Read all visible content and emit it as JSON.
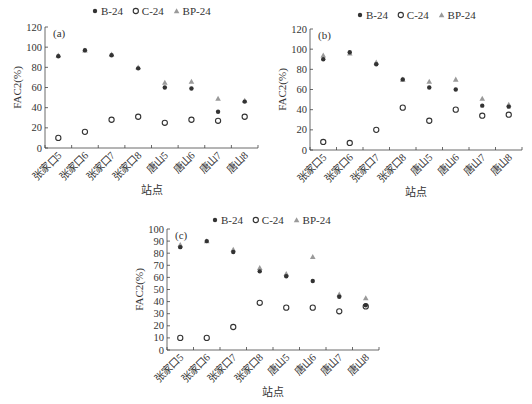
{
  "chart_data": [
    {
      "type": "scatter",
      "panel_label": "(a)",
      "title": "",
      "xlabel": "站点",
      "ylabel": "FAC2(%)",
      "ylim": [
        0,
        120
      ],
      "yticks": [
        0,
        20,
        40,
        60,
        80,
        100,
        120
      ],
      "grid": false,
      "legend_position": "top",
      "categories": [
        "张家口5",
        "张家口6",
        "张家口7",
        "张家口8",
        "唐山5",
        "唐山6",
        "唐山7",
        "唐山8"
      ],
      "series": [
        {
          "name": "B-24",
          "marker": "filled-circle",
          "color": "#333333",
          "values": [
            91,
            97,
            92,
            79,
            60,
            59,
            36,
            46
          ]
        },
        {
          "name": "C-24",
          "marker": "open-circle",
          "color": "#333333",
          "values": [
            10,
            16,
            28,
            31,
            25,
            28,
            27,
            31
          ]
        },
        {
          "name": "BP-24",
          "marker": "triangle",
          "color": "#9a9a9a",
          "values": [
            92,
            97,
            93,
            80,
            65,
            66,
            49,
            47
          ]
        }
      ]
    },
    {
      "type": "scatter",
      "panel_label": "(b)",
      "title": "",
      "xlabel": "站点",
      "ylabel": "FAC2(%)",
      "ylim": [
        0,
        120
      ],
      "yticks": [
        0,
        20,
        40,
        60,
        80,
        100,
        120
      ],
      "grid": false,
      "legend_position": "top",
      "categories": [
        "张家口5",
        "张家口6",
        "张家口7",
        "张家口8",
        "唐山5",
        "唐山6",
        "唐山7",
        "唐山8"
      ],
      "series": [
        {
          "name": "B-24",
          "marker": "filled-circle",
          "color": "#333333",
          "values": [
            90,
            97,
            85,
            70,
            62,
            60,
            44,
            43
          ]
        },
        {
          "name": "C-24",
          "marker": "open-circle",
          "color": "#333333",
          "values": [
            8,
            7,
            20,
            42,
            29,
            40,
            34,
            35
          ]
        },
        {
          "name": "BP-24",
          "marker": "triangle",
          "color": "#9a9a9a",
          "values": [
            94,
            96,
            87,
            70,
            68,
            70,
            51,
            45
          ]
        }
      ]
    },
    {
      "type": "scatter",
      "panel_label": "(c)",
      "title": "",
      "xlabel": "站点",
      "ylabel": "FAC2(%)",
      "ylim": [
        0,
        100
      ],
      "yticks": [
        0,
        10,
        20,
        30,
        40,
        50,
        60,
        70,
        80,
        90,
        100
      ],
      "grid": false,
      "legend_position": "top",
      "categories": [
        "张家口5",
        "张家口6",
        "张家口7",
        "张家口8",
        "唐山5",
        "唐山6",
        "唐山7",
        "唐山8"
      ],
      "series": [
        {
          "name": "B-24",
          "marker": "filled-circle",
          "color": "#333333",
          "values": [
            85,
            90,
            81,
            65,
            61,
            57,
            44,
            37
          ]
        },
        {
          "name": "C-24",
          "marker": "open-circle",
          "color": "#333333",
          "values": [
            10,
            10,
            19,
            39,
            35,
            35,
            32,
            36
          ]
        },
        {
          "name": "BP-24",
          "marker": "triangle",
          "color": "#9a9a9a",
          "values": [
            87,
            90,
            83,
            68,
            63,
            77,
            46,
            43
          ]
        }
      ]
    }
  ],
  "panels": [
    {
      "id": "a",
      "x": 0,
      "y": 0,
      "w": 266,
      "h": 200,
      "plot": {
        "left": 45,
        "top": 27,
        "right": 258,
        "bottom": 148
      },
      "legend_x": 95,
      "legend_y": 14,
      "xlabel_y": 194
    },
    {
      "id": "b",
      "x": 266,
      "y": 0,
      "w": 266,
      "h": 200,
      "plot": {
        "left": 44,
        "top": 29,
        "right": 256,
        "bottom": 150
      },
      "legend_x": 94,
      "legend_y": 18,
      "xlabel_y": 196
    },
    {
      "id": "c",
      "x": 130,
      "y": 200,
      "w": 280,
      "h": 204,
      "plot": {
        "left": 37,
        "top": 29,
        "right": 249,
        "bottom": 150
      },
      "legend_x": 85,
      "legend_y": 23,
      "xlabel_y": 196
    }
  ]
}
